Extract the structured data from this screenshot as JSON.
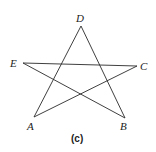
{
  "figure": {
    "caption": "(c)",
    "shape": "pentagram",
    "stroke_color": "#2a2a2a",
    "background": "#ffffff",
    "vertices": {
      "D": {
        "label": "D",
        "x": 81,
        "y": 26
      },
      "E": {
        "label": "E",
        "x": 23,
        "y": 63
      },
      "C": {
        "label": "C",
        "x": 137,
        "y": 66
      },
      "A": {
        "label": "A",
        "x": 34,
        "y": 117
      },
      "B": {
        "label": "B",
        "x": 125,
        "y": 118
      }
    },
    "segments": [
      {
        "from": "D",
        "to": "A"
      },
      {
        "from": "D",
        "to": "B"
      },
      {
        "from": "E",
        "to": "C"
      },
      {
        "from": "E",
        "to": "B"
      },
      {
        "from": "A",
        "to": "C"
      }
    ]
  }
}
